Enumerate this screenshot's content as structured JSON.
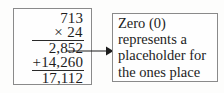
{
  "diagram": {
    "colors": {
      "background": "#fdfdfc",
      "box_border": "#8a8a8a",
      "ink": "#1d1d1d",
      "rule": "#2a2a2a",
      "arrow": "#1d1d1d"
    },
    "calculation": {
      "name": "long-multiplication",
      "multiplicand": "713",
      "multiplier": "× 24",
      "partial_product_1": "2,852",
      "partial_product_2": "+14,260",
      "product": "17,112",
      "rows": [
        {
          "id": "multiplicand",
          "text": "713",
          "rule": false
        },
        {
          "id": "multiplier",
          "text": "× 24",
          "rule": true
        },
        {
          "id": "partial-product-1",
          "text": "2,852",
          "rule": false
        },
        {
          "id": "partial-product-2",
          "text": "+14,260",
          "rule": true
        },
        {
          "id": "product",
          "text": "17,112",
          "rule": false
        }
      ]
    },
    "callout": {
      "name": "zero-placeholder-note",
      "full_text": "Zero (0) represents a placeholder for the ones place",
      "lines": [
        "Zero (0)",
        "represents a",
        "placeholder for",
        "the ones place"
      ]
    },
    "connector": {
      "name": "arrow",
      "from": "partial-product-2",
      "to": "zero-placeholder-note",
      "direction": "right",
      "style": "solid-line-with-filled-arrowhead"
    }
  }
}
